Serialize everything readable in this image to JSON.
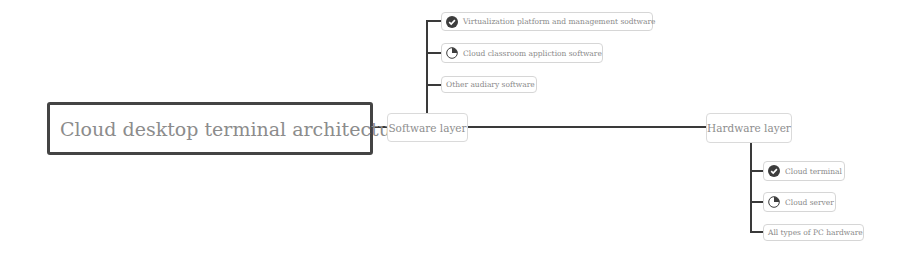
{
  "root": {
    "label": "Cloud desktop terminal architecture",
    "note_icon": "⊡"
  },
  "branches": [
    {
      "label": "Software layer",
      "children": [
        {
          "label": "Virtualization platform and management sodtware",
          "icon": "check-icon"
        },
        {
          "label": "Cloud classroom appliction software",
          "icon": "pie-quarter-icon"
        },
        {
          "label": "Other audiary software",
          "icon": null
        }
      ]
    },
    {
      "label": "Hardware layer",
      "children": [
        {
          "label": "Cloud terminal",
          "icon": "check-icon"
        },
        {
          "label": "Cloud server",
          "icon": "pie-quarter-icon"
        },
        {
          "label": "All types of PC hardware",
          "icon": null
        }
      ]
    }
  ],
  "colors": {
    "connector": "#3a3a3a",
    "root_border": "#444444",
    "node_border": "#d6d6d6",
    "text": "#8a8a8a"
  }
}
